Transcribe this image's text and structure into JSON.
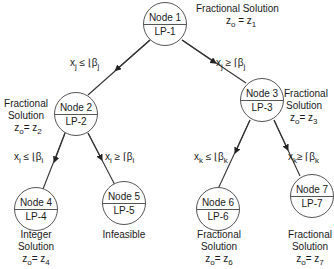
{
  "nodes": [
    {
      "id": "node-1",
      "name": "Node 1",
      "lp": "LP-1",
      "result": [
        "Fractional Solution",
        "z0 = z1"
      ]
    },
    {
      "id": "node-2",
      "name": "Node 2",
      "lp": "LP-2",
      "result": [
        "Fractional",
        "Solution",
        "z0 = z2"
      ]
    },
    {
      "id": "node-3",
      "name": "Node 3",
      "lp": "LP-3",
      "result": [
        "Fractional",
        "Solution",
        "z0 = z3"
      ]
    },
    {
      "id": "node-4",
      "name": "Node 4",
      "lp": "LP-4",
      "result": [
        "Integer",
        "Solution",
        "z0 = z4"
      ]
    },
    {
      "id": "node-5",
      "name": "Node 5",
      "lp": "LP-5",
      "result": [
        "Infeasible"
      ]
    },
    {
      "id": "node-6",
      "name": "Node 6",
      "lp": "LP-6",
      "result": [
        "Fractional",
        "Solution",
        "z0 = z6"
      ]
    },
    {
      "id": "node-7",
      "name": "Node 7",
      "lp": "LP-7",
      "result": [
        "Fractional",
        "Solution",
        "z0 = z7"
      ]
    }
  ],
  "edges": [
    {
      "from": "node-1",
      "to": "node-2",
      "constraint": "xj ≤ ⌊βj⌋"
    },
    {
      "from": "node-1",
      "to": "node-3",
      "constraint": "xj ≥ ⌈βj⌉"
    },
    {
      "from": "node-2",
      "to": "node-4",
      "constraint": "xi ≤ ⌊βi⌋"
    },
    {
      "from": "node-2",
      "to": "node-5",
      "constraint": "xi ≥ ⌈βi⌉"
    },
    {
      "from": "node-3",
      "to": "node-6",
      "constraint": "xk ≤ ⌊βk⌋"
    },
    {
      "from": "node-3",
      "to": "node-7",
      "constraint": "xk ≥ ⌈βk⌉"
    }
  ],
  "labels": {
    "n1_res1": "Fractional Solution",
    "n2_res1": "Fractional",
    "n2_res2": "Solution",
    "n3_res1": "Fractional",
    "n3_res2": "Solution",
    "n4_res1": "Integer",
    "n4_res2": "Solution",
    "n5_res1": "Infeasible",
    "n6_res1": "Fractional",
    "n6_res2": "Solution",
    "n7_res1": "Fractional",
    "n7_res2": "Solution"
  }
}
